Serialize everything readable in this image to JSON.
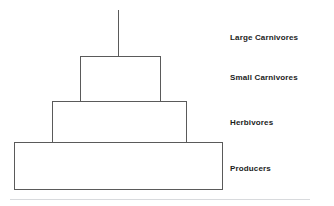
{
  "diagram": {
    "type": "ecological-pyramid",
    "tiers": [
      {
        "id": "apex",
        "label": "Large Carnivores",
        "shape": "vertical-line",
        "level": 4
      },
      {
        "id": "small-carnivores",
        "label": "Small Carnivores",
        "shape": "rectangle",
        "level": 3
      },
      {
        "id": "herbivores",
        "label": "Herbivores",
        "shape": "rectangle",
        "level": 2
      },
      {
        "id": "producers",
        "label": "Producers",
        "shape": "rectangle",
        "level": 1
      }
    ],
    "colors": {
      "outline": "#5a5a5a",
      "fill": "#ffffff",
      "label_text": "#1c1c1c",
      "footer_rule": "#d8dadd",
      "background": "#ffffff"
    }
  }
}
